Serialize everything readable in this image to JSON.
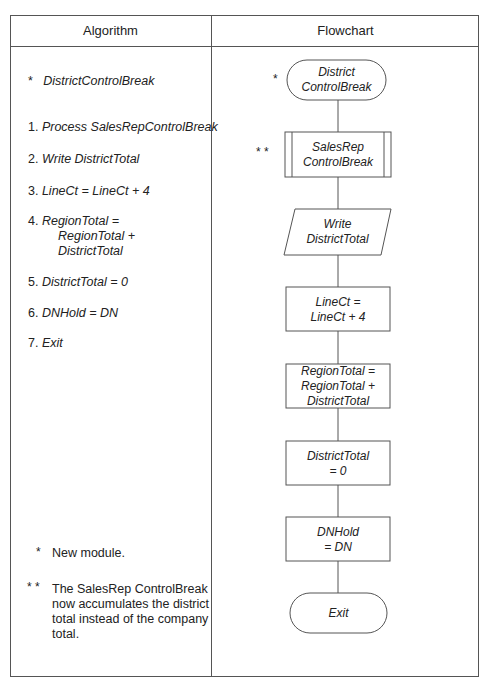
{
  "header": {
    "algorithm_label": "Algorithm",
    "flowchart_label": "Flowchart"
  },
  "algorithm": {
    "module_marker": "*",
    "module_name": "DistrictControlBreak",
    "steps": [
      {
        "num": "1.",
        "text": "Process SalesRepControlBreak"
      },
      {
        "num": "2.",
        "text": "Write DistrictTotal"
      },
      {
        "num": "3.",
        "text": "LineCt = LineCt + 4"
      },
      {
        "num": "4.",
        "line1": "RegionTotal =",
        "line2": "RegionTotal +",
        "line3": "DistrictTotal"
      },
      {
        "num": "5.",
        "text": "DistrictTotal = 0"
      },
      {
        "num": "6.",
        "text": "DNHold = DN"
      },
      {
        "num": "7.",
        "text": "Exit"
      }
    ]
  },
  "notes": [
    {
      "marker": "*",
      "text": "New module."
    },
    {
      "marker": "* *",
      "line1": "The SalesRep ControlBreak",
      "line2": "now accumulates the district",
      "line3": "total instead of the company",
      "line4": "total."
    }
  ],
  "flowchart": {
    "nodes": [
      {
        "id": "start",
        "shape": "terminal",
        "marker": "*",
        "line1": "District",
        "line2": "ControlBreak"
      },
      {
        "id": "salesrep",
        "shape": "predefined-process",
        "marker": "* *",
        "line1": "SalesRep",
        "line2": "ControlBreak"
      },
      {
        "id": "write",
        "shape": "io",
        "line1": "Write",
        "line2": "DistrictTotal"
      },
      {
        "id": "linect",
        "shape": "process",
        "line1": "LineCt =",
        "line2": "LineCt + 4"
      },
      {
        "id": "region",
        "shape": "process",
        "line1": "RegionTotal =",
        "line2": "RegionTotal +",
        "line3": "DistrictTotal"
      },
      {
        "id": "district",
        "shape": "process",
        "line1": "DistrictTotal",
        "line2": "= 0"
      },
      {
        "id": "dnhold",
        "shape": "process",
        "line1": "DNHold",
        "line2": "= DN"
      },
      {
        "id": "exit",
        "shape": "terminal",
        "line1": "Exit"
      }
    ]
  }
}
